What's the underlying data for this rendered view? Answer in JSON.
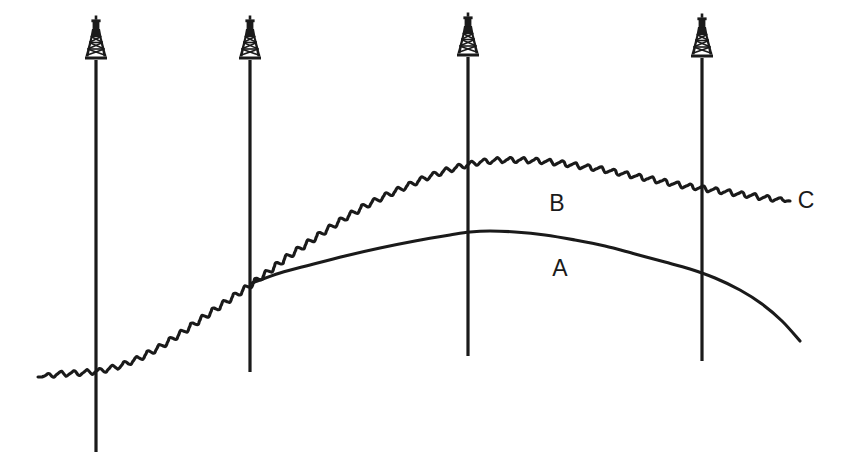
{
  "figure": {
    "kind": "geological-cross-section",
    "background_color": "#ffffff",
    "ink_color": "#1a1a1a",
    "width": 850,
    "height": 473
  },
  "labels": [
    {
      "name": "horizon-label-b",
      "text": "B",
      "x": 557,
      "y": 211
    },
    {
      "name": "horizon-label-a",
      "text": "A",
      "x": 560,
      "y": 276
    },
    {
      "name": "horizon-label-c",
      "text": "C",
      "x": 806,
      "y": 208
    }
  ],
  "wells": [
    {
      "name": "well-1",
      "label": "1",
      "x": 96,
      "top": 60,
      "bottom": 452,
      "derrick_base_y": 60
    },
    {
      "name": "well-2",
      "label": "2",
      "x": 250,
      "top": 60,
      "bottom": 372,
      "derrick_base_y": 60
    },
    {
      "name": "well-3",
      "label": "3",
      "x": 468,
      "top": 57,
      "bottom": 356,
      "derrick_base_y": 57
    },
    {
      "name": "well-4",
      "label": "4",
      "x": 702,
      "top": 58,
      "bottom": 361,
      "derrick_base_y": 58
    }
  ],
  "curves": {
    "curve_a": {
      "name": "horizon-a",
      "style": "smooth",
      "stroke_width": 3.1,
      "points": [
        [
          252,
          283
        ],
        [
          280,
          273
        ],
        [
          310,
          265
        ],
        [
          345,
          256
        ],
        [
          380,
          248
        ],
        [
          415,
          241
        ],
        [
          450,
          235
        ],
        [
          470,
          232
        ],
        [
          490,
          231
        ],
        [
          515,
          232
        ],
        [
          545,
          235
        ],
        [
          575,
          240
        ],
        [
          605,
          246
        ],
        [
          635,
          254
        ],
        [
          665,
          262
        ],
        [
          690,
          269
        ],
        [
          715,
          278
        ],
        [
          740,
          290
        ],
        [
          762,
          304
        ],
        [
          782,
          321
        ],
        [
          800,
          341
        ]
      ]
    },
    "curve_c": {
      "name": "horizon-c",
      "style": "wiggly",
      "stroke_width": 3.1,
      "wiggle_amplitude": 3.0,
      "wiggle_period": 13,
      "points": [
        [
          38,
          377
        ],
        [
          58,
          374
        ],
        [
          80,
          373
        ],
        [
          100,
          371
        ],
        [
          120,
          366
        ],
        [
          140,
          358
        ],
        [
          160,
          347
        ],
        [
          180,
          334
        ],
        [
          200,
          320
        ],
        [
          220,
          306
        ],
        [
          236,
          295
        ],
        [
          252,
          284
        ],
        [
          268,
          272
        ],
        [
          286,
          258
        ],
        [
          305,
          245
        ],
        [
          325,
          231
        ],
        [
          345,
          218
        ],
        [
          365,
          206
        ],
        [
          385,
          196
        ],
        [
          405,
          187
        ],
        [
          425,
          178
        ],
        [
          445,
          171
        ],
        [
          462,
          166
        ],
        [
          480,
          162
        ],
        [
          500,
          160
        ],
        [
          520,
          160
        ],
        [
          540,
          161
        ],
        [
          560,
          163
        ],
        [
          580,
          166
        ],
        [
          600,
          169
        ],
        [
          620,
          173
        ],
        [
          640,
          177
        ],
        [
          660,
          181
        ],
        [
          680,
          185
        ],
        [
          700,
          188
        ],
        [
          720,
          191
        ],
        [
          740,
          194
        ],
        [
          760,
          197
        ],
        [
          775,
          199
        ],
        [
          790,
          201
        ]
      ]
    }
  }
}
